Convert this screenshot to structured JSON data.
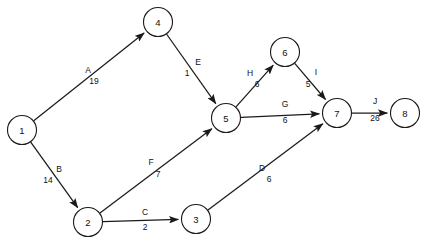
{
  "diagram": {
    "type": "directed-weighted-network",
    "title": "",
    "node_radius": 14.5,
    "colors": {
      "background": "#ffffff",
      "stroke": "#1a1a1a",
      "text": "#111111"
    },
    "nodes": [
      {
        "id": "1",
        "label": "1",
        "cx": 22,
        "cy": 130
      },
      {
        "id": "2",
        "label": "2",
        "cx": 88,
        "cy": 222
      },
      {
        "id": "3",
        "label": "3",
        "cx": 196,
        "cy": 219
      },
      {
        "id": "4",
        "label": "4",
        "cx": 158,
        "cy": 22
      },
      {
        "id": "5",
        "label": "5",
        "cx": 226,
        "cy": 118
      },
      {
        "id": "6",
        "label": "6",
        "cx": 285,
        "cy": 52
      },
      {
        "id": "7",
        "label": "7",
        "cx": 337,
        "cy": 113
      },
      {
        "id": "8",
        "label": "8",
        "cx": 405,
        "cy": 113
      }
    ],
    "edges": [
      {
        "name": "A",
        "weight": "19",
        "from": "1",
        "to": "4",
        "name_x": 88,
        "name_y": 70,
        "weight_x": 94,
        "weight_y": 81
      },
      {
        "name": "B",
        "weight": "14",
        "from": "1",
        "to": "2",
        "name_x": 59,
        "name_y": 169,
        "weight_x": 48,
        "weight_y": 180
      },
      {
        "name": "C",
        "weight": "2",
        "from": "2",
        "to": "3",
        "name_x": 145,
        "name_y": 212,
        "weight_x": 145,
        "weight_y": 227
      },
      {
        "name": "D",
        "weight": "6",
        "from": "3",
        "to": "7",
        "name_x": 262,
        "name_y": 168,
        "weight_x": 269,
        "weight_y": 179
      },
      {
        "name": "E",
        "weight": "1",
        "from": "4",
        "to": "5",
        "name_x": 198,
        "name_y": 62,
        "weight_x": 187,
        "weight_y": 73
      },
      {
        "name": "F",
        "weight": "7",
        "from": "2",
        "to": "5",
        "name_x": 151,
        "name_y": 162,
        "weight_x": 158,
        "weight_y": 174
      },
      {
        "name": "G",
        "weight": "6",
        "from": "5",
        "to": "7",
        "name_x": 285,
        "name_y": 104,
        "weight_x": 285,
        "weight_y": 120
      },
      {
        "name": "H",
        "weight": "6",
        "from": "5",
        "to": "6",
        "name_x": 250,
        "name_y": 73,
        "weight_x": 257,
        "weight_y": 84
      },
      {
        "name": "I",
        "weight": "5",
        "from": "6",
        "to": "7",
        "name_x": 316,
        "name_y": 72,
        "weight_x": 308,
        "weight_y": 84
      },
      {
        "name": "J",
        "weight": "26",
        "from": "7",
        "to": "8",
        "name_x": 375,
        "name_y": 101,
        "weight_x": 375,
        "weight_y": 118
      }
    ]
  }
}
